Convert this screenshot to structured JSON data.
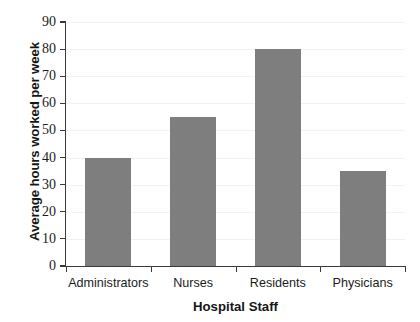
{
  "chart_data": {
    "type": "bar",
    "title": "",
    "title_cropped": true,
    "categories": [
      "Administrators",
      "Nurses",
      "Residents",
      "Physicians"
    ],
    "values": [
      40,
      55,
      80,
      35
    ],
    "series": [
      {
        "name": "Average hours worked per week",
        "values": [
          40,
          55,
          80,
          35
        ]
      }
    ],
    "xlabel": "Hospital Staff",
    "ylabel": "Average hours worked per week",
    "ylim": [
      0,
      90
    ],
    "ytick_step": 10,
    "yticks": [
      90,
      80,
      70,
      60,
      50,
      40,
      30,
      20,
      10,
      0
    ],
    "ytick_labels": [
      "90",
      "80",
      "70",
      "60",
      "50",
      "40",
      "30",
      "20",
      "10",
      "0"
    ],
    "grid": true,
    "legend": false,
    "legend_position": "none",
    "bar_color": "#7e7e7e",
    "axis_color": "#3a3a3a",
    "gridline_color": "#f2f2f2",
    "background_color": "#ffffff"
  }
}
